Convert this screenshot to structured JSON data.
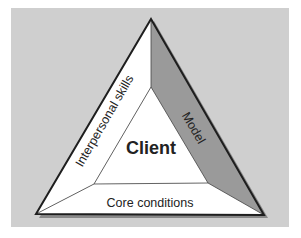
{
  "diagram": {
    "center_label": "Client",
    "sides": {
      "left": "Interpersonal skills",
      "right": "Model",
      "bottom": "Core conditions"
    },
    "colors": {
      "background": "#cfcfcf",
      "panel_white": "#ffffff",
      "panel_model": "#9a9a9a",
      "outline": "#1e1e1e"
    }
  }
}
